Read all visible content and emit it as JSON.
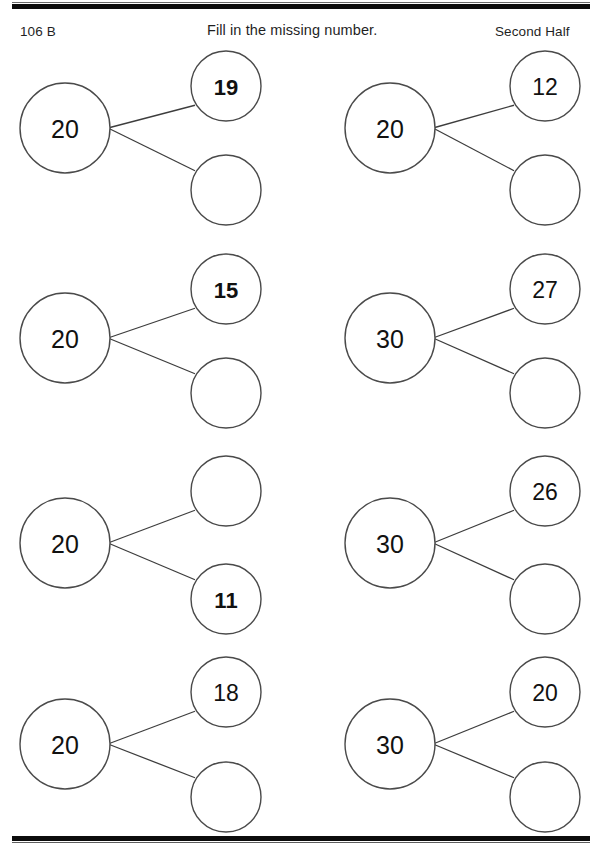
{
  "page": {
    "code": "106 B",
    "instruction": "Fill in the missing number.",
    "section_label": "Second Half",
    "ink_color": "#111111",
    "circle_stroke_color": "#4a4a4a",
    "rule_color": "#0c0c0c"
  },
  "worksheet": {
    "type": "number-bonds",
    "columns": 2,
    "rows": 4,
    "problems": [
      {
        "id": 1,
        "column": "left",
        "row": 1,
        "whole": "20",
        "top_part": "19",
        "bottom_part": "",
        "top_part_bold": true,
        "bottom_part_bold": false,
        "missing": "bottom"
      },
      {
        "id": 2,
        "column": "right",
        "row": 1,
        "whole": "20",
        "top_part": "12",
        "bottom_part": "",
        "top_part_bold": false,
        "bottom_part_bold": false,
        "missing": "bottom"
      },
      {
        "id": 3,
        "column": "left",
        "row": 2,
        "whole": "20",
        "top_part": "15",
        "bottom_part": "",
        "top_part_bold": true,
        "bottom_part_bold": false,
        "missing": "bottom"
      },
      {
        "id": 4,
        "column": "right",
        "row": 2,
        "whole": "30",
        "top_part": "27",
        "bottom_part": "",
        "top_part_bold": false,
        "bottom_part_bold": false,
        "missing": "bottom"
      },
      {
        "id": 5,
        "column": "left",
        "row": 3,
        "whole": "20",
        "top_part": "",
        "bottom_part": "11",
        "top_part_bold": false,
        "bottom_part_bold": true,
        "missing": "top"
      },
      {
        "id": 6,
        "column": "right",
        "row": 3,
        "whole": "30",
        "top_part": "26",
        "bottom_part": "",
        "top_part_bold": false,
        "bottom_part_bold": false,
        "missing": "bottom"
      },
      {
        "id": 7,
        "column": "left",
        "row": 4,
        "whole": "20",
        "top_part": "18",
        "bottom_part": "",
        "top_part_bold": false,
        "bottom_part_bold": false,
        "missing": "bottom"
      },
      {
        "id": 8,
        "column": "right",
        "row": 4,
        "whole": "30",
        "top_part": "20",
        "bottom_part": "",
        "top_part_bold": false,
        "bottom_part_bold": false,
        "missing": "bottom"
      }
    ],
    "geometry": {
      "whole_radius": 45,
      "part_radius": 35,
      "left_whole_cx": 65,
      "right_whole_cx": 390,
      "left_part_cx": 226,
      "right_part_cx": 545,
      "row_whole_cy": [
        128,
        338,
        543,
        744
      ],
      "row_top_cy": [
        86,
        289,
        491,
        692
      ],
      "row_bottom_cy": [
        190,
        393,
        599,
        797
      ]
    }
  }
}
